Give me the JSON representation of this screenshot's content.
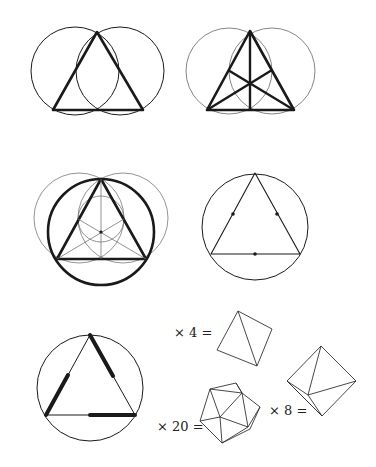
{
  "figure": {
    "colors": {
      "stroke": "#1a1a1a",
      "thin_stroke": "#555555",
      "background": "#ffffff"
    },
    "panels": [
      {
        "id": "two-circles-triangle",
        "caption": ""
      },
      {
        "id": "triangle-with-medians",
        "caption": ""
      },
      {
        "id": "circumscribed-circle-construction",
        "caption": ""
      },
      {
        "id": "triangle-in-circle-midpoints",
        "caption": ""
      },
      {
        "id": "triangle-half-edges-bold",
        "caption": ""
      }
    ],
    "solids": [
      {
        "id": "tetrahedron",
        "label": "× 4 =",
        "faces": 4
      },
      {
        "id": "icosahedron",
        "label": "× 20 =",
        "faces": 20
      },
      {
        "id": "octahedron",
        "label": "× 8 =",
        "faces": 8
      }
    ]
  }
}
